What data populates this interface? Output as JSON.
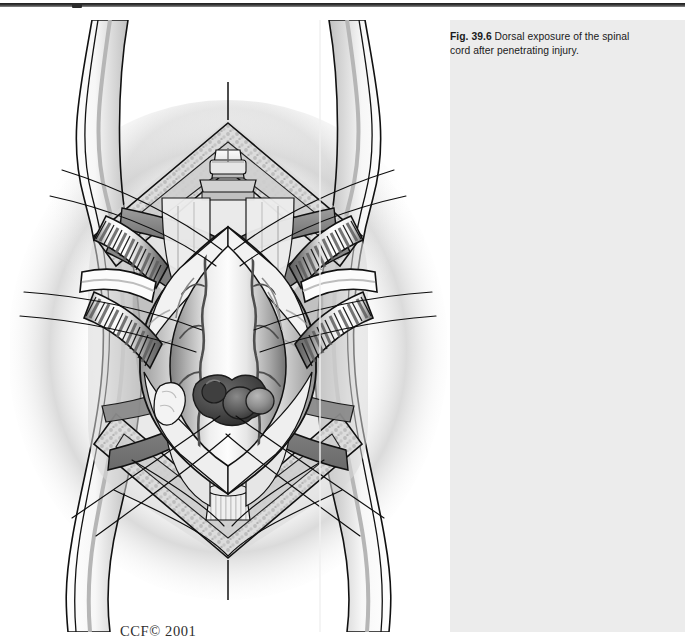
{
  "page": {
    "background_color": "#ffffff",
    "top_rule_color": "#2b2b2b"
  },
  "caption": {
    "label": "Fig. 39.6",
    "text": " Dorsal exposure of the spinal cord after penetrating injury.",
    "full_text": "Fig. 39.6 Dorsal exposure of the spinal cord after penetrating injury.",
    "background_color": "#ececec",
    "text_color": "#1a1a1a"
  },
  "figure": {
    "credit": "CCF© 2001",
    "credit_color": "#2e2e2e",
    "alt": "Grayscale medical illustration: dorsal midline exposure of the spinal cord with laminectomy, retracted paraspinal muscles, opened dura held by stay sutures, and dark hemorrhagic masses on the cord from a penetrating injury.",
    "palette": {
      "ink": "#101010",
      "muscle": "#8e8e8e",
      "muscle_dark": "#6f6f6f",
      "bone": "#d8d8d8",
      "cancellous": "#c9c9c9",
      "cord": "#cfcfcf",
      "cord_highlight": "#f4f4f4",
      "dura": "#e9e9e9",
      "retractor": "#fdfdfd",
      "retractor_shade": "#7d7d7d",
      "hematoma": "#4a4a4a",
      "hematoma_dark": "#3a3a3a",
      "vessel": "#5a5a5a",
      "halo": "#b9b9b9"
    }
  }
}
